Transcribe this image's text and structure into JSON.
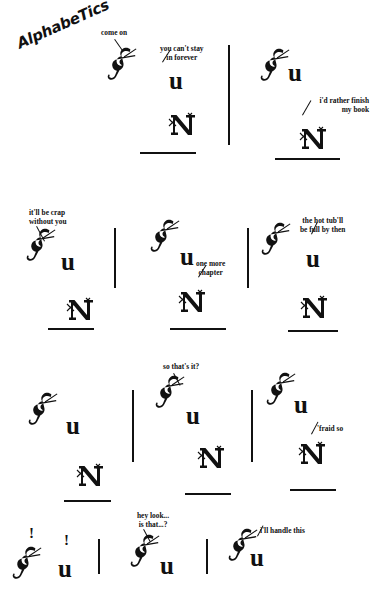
{
  "comic": {
    "title": "AlphabeTics",
    "letters": {
      "f": "F",
      "u": "u",
      "n": "N",
      "bang": "!"
    },
    "panels": [
      {
        "id": "p1",
        "row": 1,
        "col": 1,
        "speech": [
          "come on",
          "you can't stay",
          "in forever"
        ],
        "letters": [
          "F",
          "u",
          "N"
        ]
      },
      {
        "id": "p2",
        "row": 1,
        "col": 2,
        "speech": [
          "i'd rather finish",
          "my book"
        ],
        "letters": [
          "F",
          "u",
          "N"
        ]
      },
      {
        "id": "p3",
        "row": 2,
        "col": 1,
        "speech": [
          "it'll be crap",
          "without you"
        ],
        "letters": [
          "F",
          "u",
          "N"
        ]
      },
      {
        "id": "p4",
        "row": 2,
        "col": 2,
        "speech": [
          "one more",
          "chapter"
        ],
        "letters": [
          "F",
          "u",
          "N"
        ]
      },
      {
        "id": "p5",
        "row": 2,
        "col": 3,
        "speech": [
          "the hot tub'll",
          "be full by then"
        ],
        "letters": [
          "F",
          "u",
          "N"
        ]
      },
      {
        "id": "p6",
        "row": 3,
        "col": 1,
        "speech": [],
        "letters": [
          "F",
          "u",
          "N"
        ]
      },
      {
        "id": "p7",
        "row": 3,
        "col": 2,
        "speech": [
          "so that's it?"
        ],
        "letters": [
          "F",
          "u",
          "N"
        ]
      },
      {
        "id": "p8",
        "row": 3,
        "col": 3,
        "speech": [
          "'fraid so"
        ],
        "letters": [
          "F",
          "u",
          "N"
        ]
      },
      {
        "id": "p9",
        "row": 4,
        "col": 1,
        "speech": [
          "!",
          "!"
        ],
        "letters": [
          "F",
          "u"
        ]
      },
      {
        "id": "p10",
        "row": 4,
        "col": 2,
        "speech": [
          "hey look...",
          "is that...?"
        ],
        "letters": [
          "F",
          "u"
        ]
      },
      {
        "id": "p11",
        "row": 4,
        "col": 3,
        "speech": [
          "i'll handle this"
        ],
        "letters": [
          "F",
          "u"
        ]
      }
    ],
    "lines": {
      "come_on": "come on",
      "cant_stay_1": "you can't stay",
      "cant_stay_2": "in forever",
      "rather_finish_1": "i'd rather finish",
      "rather_finish_2": "my book",
      "be_crap_1": "it'll be crap",
      "be_crap_2": "without you",
      "one_more_1": "one more",
      "one_more_2": "chapter",
      "hot_tub_1": "the hot tub'll",
      "hot_tub_2": "be full by then",
      "so_thats_it": "so that's it?",
      "fraid_so": "'fraid so",
      "hey_look_1": "hey look...",
      "hey_look_2": "is that...?",
      "handle_this": "i'll handle this",
      "bang1": "!",
      "bang2": "!"
    },
    "colors": {
      "ink": "#111111",
      "paper": "#ffffff"
    }
  }
}
